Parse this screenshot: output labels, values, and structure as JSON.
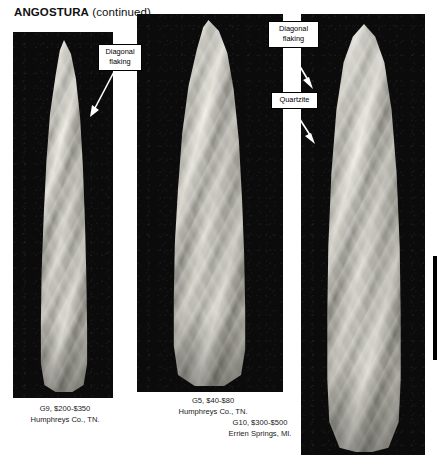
{
  "page": {
    "title_main": "ANGOSTURA",
    "title_suffix": " (continued)"
  },
  "plates": [
    {
      "id": "plate-1",
      "caption_line1": "G9, $200-$350",
      "caption_line2": "Humphreys Co., TN.",
      "caption": "G9, $200-$350\nHumphreys Co., TN.",
      "grade": "G9",
      "price_range": "$200-$350",
      "provenance": "Humphreys Co., TN."
    },
    {
      "id": "plate-2",
      "caption_line1": "G5, $40-$80",
      "caption_line2": "Humphreys Co., TN.",
      "caption": "G5, $40-$80\nHumphreys Co., TN.",
      "grade": "G5",
      "price_range": "$40-$80",
      "provenance": "Humphreys Co., TN."
    },
    {
      "id": "plate-3",
      "caption_line1": "G10, $300-$500",
      "caption_line2": "Errien Springs, MI.",
      "caption": "G10, $300-$500\nErrien Springs, MI.",
      "grade": "G10",
      "price_range": "$300-$500",
      "provenance": "Errien Springs, MI."
    }
  ],
  "callouts": [
    {
      "id": "callout-1",
      "text": "Diagonal\nflaking",
      "target": "plate-1"
    },
    {
      "id": "callout-2",
      "text": "Diagonal\nflaking",
      "target": "plate-3"
    },
    {
      "id": "callout-3",
      "text": "Quartzite",
      "target": "plate-3"
    }
  ],
  "colors": {
    "plate_background": "#0b0b0b",
    "page_background": "#ffffff",
    "text": "#111111",
    "callout_border": "#000000",
    "margin_rule": "#000000"
  }
}
